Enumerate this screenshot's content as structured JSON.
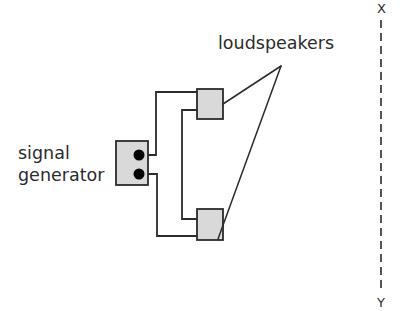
{
  "figure": {
    "type": "schematic-diagram",
    "background_color": "#ffffff",
    "line_color": "#2b2b2b",
    "box_fill_color": "#d9d9d9",
    "terminal_color": "#000000"
  },
  "labels": {
    "loudspeakers": "loudspeakers",
    "signal_line1": "signal",
    "signal_line2": "generator",
    "axis_top": "X",
    "axis_bottom": "Y"
  },
  "components": {
    "signal_generator": {
      "name": "signal generator",
      "x": 116,
      "y": 141,
      "width": 32,
      "height": 44,
      "terminals": [
        {
          "name": "terminal-top",
          "cx": 139,
          "cy": 155,
          "r": 5.5
        },
        {
          "name": "terminal-bottom",
          "cx": 139,
          "cy": 174,
          "r": 5.5
        }
      ]
    },
    "speaker_top": {
      "name": "loudspeaker-top",
      "x": 197,
      "y": 89,
      "width": 26,
      "height": 30
    },
    "speaker_bottom": {
      "name": "loudspeaker-bottom",
      "x": 197,
      "y": 209,
      "width": 26,
      "height": 31
    }
  },
  "wires": [
    {
      "name": "wire-top-terminal-to-top-speaker",
      "points": "148,155 156,155 156,92 197,92"
    },
    {
      "name": "wire-top-speaker-to-bottom-speaker",
      "points": "197,110 182,110 182,219 197,219"
    },
    {
      "name": "wire-bottom-terminal-to-bottom-speaker",
      "points": "148,174 157,174 157,236 197,236"
    }
  ],
  "leader_lines": {
    "apex": {
      "x": 281,
      "y": 66
    },
    "targets": [
      {
        "name": "leader-to-top-speaker",
        "x": 223,
        "y": 104
      },
      {
        "name": "leader-to-bottom-speaker",
        "x": 218,
        "y": 239
      }
    ]
  },
  "label_positions": {
    "loudspeakers": {
      "x": 218,
      "y": 49
    },
    "signal": {
      "x": 18,
      "y": 159
    },
    "generator": {
      "x": 18,
      "y": 181
    },
    "axis_top": {
      "x": 377,
      "y": 13
    },
    "axis_bottom": {
      "x": 377,
      "y": 307
    }
  },
  "reference_line": {
    "name": "dashed-reference-line-XY",
    "x": 381,
    "y_start": 20,
    "y_end": 292,
    "dash": "8 5",
    "width": 1.6
  }
}
